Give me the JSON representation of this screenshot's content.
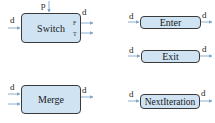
{
  "nodes": {
    "switch": {
      "label": "Switch",
      "input_data": "d",
      "input_pred": "p",
      "output_data": "d",
      "out_false": "F",
      "out_true": "T"
    },
    "enter": {
      "label": "Enter",
      "input": "d",
      "output": "d"
    },
    "exit": {
      "label": "Exit",
      "input": "d",
      "output": "d"
    },
    "merge": {
      "label": "Merge",
      "input": "d",
      "output": "d"
    },
    "next_iteration": {
      "label": "NextIteration",
      "input": "d",
      "output": "d"
    }
  },
  "colors": {
    "node_fill": "#cfe3f3",
    "node_border": "#3a3a3a",
    "arrow": "#7fa6c8"
  }
}
